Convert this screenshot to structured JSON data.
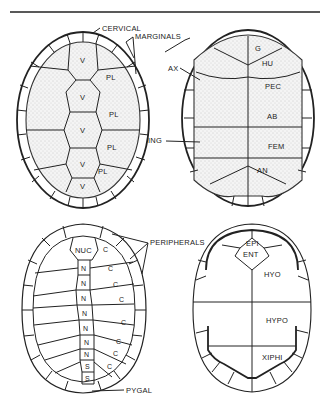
{
  "figure": {
    "panels": [
      {
        "id": "carapace-scutes",
        "position": "top-left",
        "labels": [
          "CERVICAL",
          "MARGINALS",
          "V",
          "PL"
        ],
        "scutes": {
          "vertebral": "V",
          "pleural": "PL"
        }
      },
      {
        "id": "plastron-scutes",
        "position": "top-right",
        "labels": [
          "AX",
          "ING",
          "G",
          "HU",
          "PEC",
          "AB",
          "FEM",
          "AN"
        ]
      },
      {
        "id": "carapace-bones",
        "position": "bottom-left",
        "labels": [
          "NUC",
          "PERIPHERALS",
          "N",
          "C",
          "S",
          "PYGAL"
        ]
      },
      {
        "id": "plastron-bones",
        "position": "bottom-right",
        "labels": [
          "EPI",
          "ENT",
          "HYO",
          "HYPO",
          "XIPHI"
        ]
      }
    ]
  },
  "labels": {
    "cervical": "CERVICAL",
    "marginals": "MARGINALS",
    "v": "V",
    "pl": "PL",
    "ax": "AX",
    "ing": "ING",
    "g": "G",
    "hu": "HU",
    "pec": "PEC",
    "ab": "AB",
    "fem": "FEM",
    "an": "AN",
    "nuc": "NUC",
    "peripherals": "PERIPHERALS",
    "n": "N",
    "c": "C",
    "s": "S",
    "pygal": "PYGAL",
    "epi": "EPI",
    "ent": "ENT",
    "hyo": "HYO",
    "hypo": "HYPO",
    "xiphi": "XIPHI"
  },
  "colors": {
    "ink": "#222222",
    "paper": "#ffffff",
    "stipple": "#cfcfcf"
  }
}
